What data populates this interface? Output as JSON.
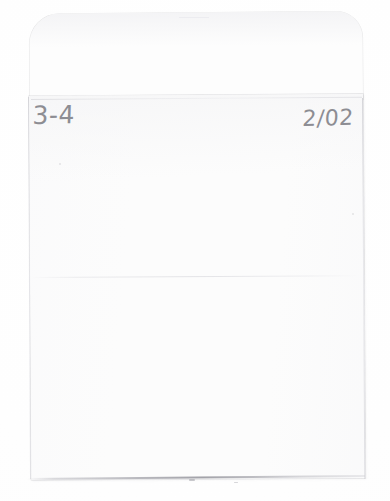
{
  "document": {
    "kind": "scanned-envelope",
    "orientation": "portrait",
    "page_width": 390,
    "page_height": 501,
    "background_color": "#ffffff",
    "paper_color": "#fcfcfc"
  },
  "envelope": {
    "flap": {
      "position": "top",
      "shape": "rounded-corners",
      "color": "#fdfdfd"
    },
    "body": {
      "color": "#fcfcfc",
      "edge_color": "#cdcdd2"
    }
  },
  "annotations": {
    "ink_color": "#8d8d93",
    "medium": "pencil",
    "left_label": "3-4",
    "right_date": "2/02"
  }
}
